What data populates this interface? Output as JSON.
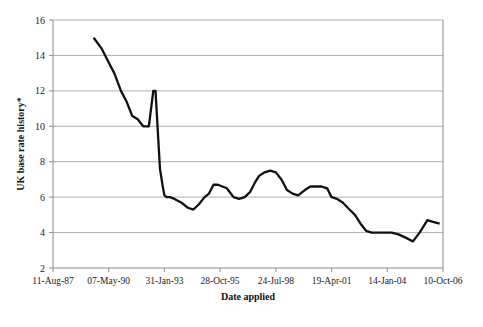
{
  "chart_data": {
    "type": "line",
    "title": "",
    "xlabel": "Date applied",
    "ylabel": "UK base rate history*",
    "ylim": [
      2,
      16
    ],
    "yticks": [
      2,
      4,
      6,
      8,
      10,
      12,
      14,
      16
    ],
    "ytick_labels": [
      "2",
      "4",
      "6",
      "8",
      "10",
      "12",
      "14",
      "16"
    ],
    "xtick_labels": [
      "11-Aug-87",
      "07-May-90",
      "31-Jan-93",
      "28-Oct-95",
      "24-Jul-98",
      "19-Apr-01",
      "14-Jan-04",
      "10-Oct-06"
    ],
    "xtick_positions": [
      0,
      1,
      2,
      3,
      4,
      5,
      6,
      7
    ],
    "xlim": [
      0,
      7
    ],
    "grid": "horizontal",
    "legend": "none",
    "series": [
      {
        "name": "UK base rate",
        "color": "#111111",
        "x": [
          0.73,
          0.87,
          1.0,
          1.1,
          1.22,
          1.32,
          1.42,
          1.52,
          1.62,
          1.72,
          1.8,
          1.84,
          1.88,
          1.92,
          1.97,
          2.0,
          2.04,
          2.1,
          2.18,
          2.3,
          2.42,
          2.52,
          2.62,
          2.72,
          2.8,
          2.88,
          2.96,
          3.04,
          3.12,
          3.24,
          3.34,
          3.44,
          3.54,
          3.62,
          3.7,
          3.8,
          3.9,
          4.0,
          4.1,
          4.2,
          4.3,
          4.4,
          4.52,
          4.62,
          4.72,
          4.82,
          4.92,
          5.0,
          5.1,
          5.2,
          5.32,
          5.42,
          5.52,
          5.62,
          5.72,
          5.84,
          5.96,
          6.08,
          6.2,
          6.34,
          6.46,
          6.58,
          6.72,
          6.82
        ],
        "y": [
          15.0,
          14.4,
          13.6,
          13.0,
          12.0,
          11.4,
          10.6,
          10.4,
          10.0,
          10.0,
          12.0,
          12.0,
          9.8,
          7.6,
          6.6,
          6.1,
          6.0,
          6.0,
          5.9,
          5.7,
          5.4,
          5.3,
          5.6,
          6.0,
          6.2,
          6.7,
          6.7,
          6.6,
          6.5,
          6.0,
          5.9,
          6.0,
          6.3,
          6.8,
          7.2,
          7.4,
          7.5,
          7.4,
          7.0,
          6.4,
          6.2,
          6.1,
          6.4,
          6.6,
          6.6,
          6.6,
          6.5,
          6.0,
          5.9,
          5.7,
          5.3,
          5.0,
          4.5,
          4.1,
          4.0,
          4.0,
          4.0,
          4.0,
          3.9,
          3.7,
          3.5,
          4.0,
          4.7,
          4.6
        ],
        "y_end": 4.5
      }
    ]
  },
  "axes": {
    "y_axis_title": "UK base rate history*",
    "x_axis_title": "Date applied"
  }
}
